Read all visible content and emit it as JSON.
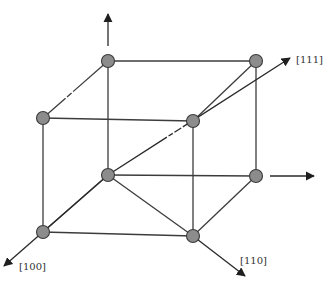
{
  "diagram": {
    "title": "",
    "colors": {
      "background": "#ffffff",
      "edge": "#3c3c3c",
      "node_fill": "#8c8c8c",
      "node_stroke": "#3a3a3a",
      "arrow": "#1f1f1f",
      "label": "#333333"
    },
    "nodes": [
      {
        "id": "top-back-left",
        "x": 108,
        "y": 61
      },
      {
        "id": "top-back-right",
        "x": 256,
        "y": 61
      },
      {
        "id": "top-front-left",
        "x": 43,
        "y": 118
      },
      {
        "id": "top-front-right",
        "x": 193,
        "y": 121
      },
      {
        "id": "bottom-back-left",
        "x": 108,
        "y": 175
      },
      {
        "id": "bottom-back-right",
        "x": 256,
        "y": 176
      },
      {
        "id": "bottom-front-left",
        "x": 43,
        "y": 232
      },
      {
        "id": "bottom-front-right",
        "x": 193,
        "y": 236
      }
    ],
    "labels": {
      "dir_111": "[111]",
      "dir_100": "[100]",
      "dir_110": "[110]"
    }
  }
}
